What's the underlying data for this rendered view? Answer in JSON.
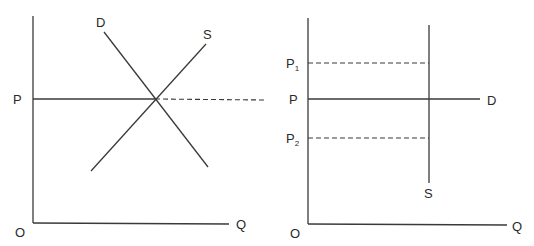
{
  "left_panel": {
    "origin_label": "O",
    "x_axis_label": "Q",
    "price_label": "P",
    "demand_label": "D",
    "supply_label": "S"
  },
  "right_panel": {
    "origin_label": "O",
    "x_axis_label": "Q",
    "price_label": "P",
    "price_high_label": "P",
    "price_high_sub": "1",
    "price_low_label": "P",
    "price_low_sub": "2",
    "demand_label": "D",
    "supply_label": "S"
  },
  "colors": {
    "line": "#3a3a3a",
    "text": "#2a2a2a",
    "background": "#ffffff"
  }
}
